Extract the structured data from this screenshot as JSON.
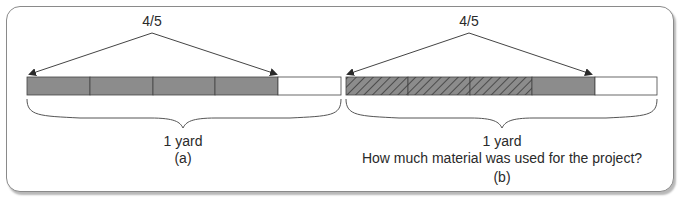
{
  "figure": {
    "panel_a": {
      "fraction_label": "4/5",
      "whole_label": "1 yard",
      "caption": "(a)",
      "segments": 5,
      "shaded_segments": 4,
      "hatched_segments": 0
    },
    "panel_b": {
      "fraction_label": "4/5",
      "whole_label": "1 yard",
      "question": "How much material was used for the project?",
      "caption": "(b)",
      "segments": 5,
      "shaded_segments": 4,
      "hatched_segments": 3
    },
    "colors": {
      "shaded": "#8c8c8c",
      "unshaded": "#ffffff",
      "outline": "#444444",
      "hatch": "#3a3a3a",
      "frame": "#8a8a8a"
    }
  }
}
